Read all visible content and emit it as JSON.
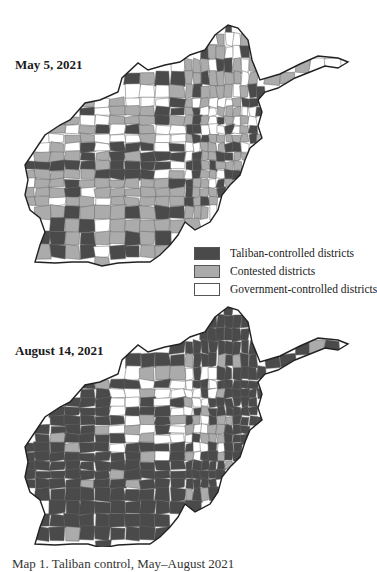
{
  "colors": {
    "taliban": "#4a4a4a",
    "contested": "#ababab",
    "government": "#ffffff",
    "border": "#222222",
    "district_line": "#666666"
  },
  "maps": [
    {
      "id": "may",
      "label": "May 5, 2021",
      "dominant_status": "contested"
    },
    {
      "id": "august",
      "label": "August 14, 2021",
      "dominant_status": "taliban"
    }
  ],
  "legend": {
    "items": [
      {
        "key": "taliban",
        "label": "Taliban-controlled districts"
      },
      {
        "key": "contested",
        "label": "Contested districts"
      },
      {
        "key": "government",
        "label": "Government-controlled districts"
      }
    ]
  },
  "caption": "Map 1. Taliban control, May–August 2021"
}
